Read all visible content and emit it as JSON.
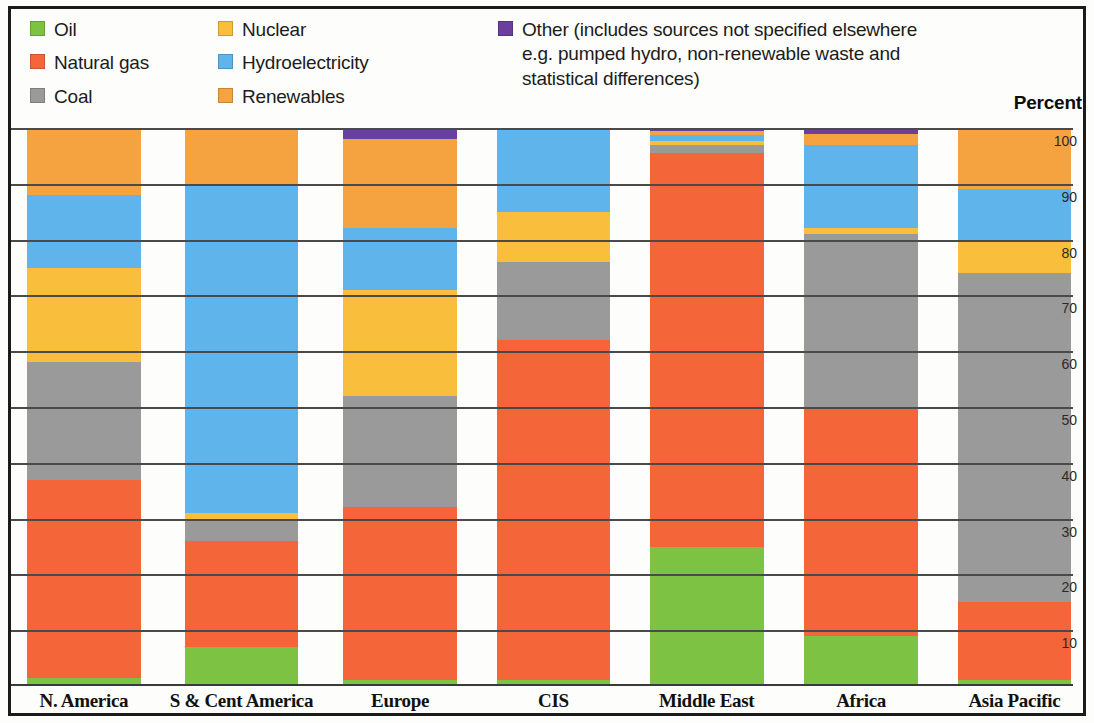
{
  "legend": {
    "columns": [
      {
        "items": [
          {
            "label": "Oil",
            "key": "oil",
            "color": "#7DC242"
          },
          {
            "label": "Natural gas",
            "key": "gas",
            "color": "#F4663A"
          },
          {
            "label": "Coal",
            "key": "coal",
            "color": "#9A9A9A"
          }
        ]
      },
      {
        "items": [
          {
            "label": "Nuclear",
            "key": "nuclear",
            "color": "#F9BE3C"
          },
          {
            "label": "Hydroelectricity",
            "key": "hydro",
            "color": "#60B4EC"
          },
          {
            "label": "Renewables",
            "key": "renewables",
            "color": "#F5A340"
          }
        ]
      },
      {
        "items": [
          {
            "label": "Other (includes sources not specified elsewhere\ne.g. pumped hydro, non-renewable waste and\nstatistical differences)",
            "key": "other",
            "color": "#6B3F9E"
          }
        ]
      }
    ]
  },
  "axis": {
    "unit_label": "Percent",
    "ticks": [
      100,
      90,
      80,
      70,
      60,
      50,
      40,
      30,
      20,
      10
    ],
    "min": 0,
    "max": 100
  },
  "chart_data": {
    "type": "bar",
    "title": "",
    "subtitle": "",
    "xlabel": "",
    "ylabel": "Percent",
    "ylim": [
      0,
      100
    ],
    "stacked": true,
    "normalized_to_100": true,
    "grid": true,
    "legend_position": "top",
    "categories": [
      "N. America",
      "S & Cent America",
      "Europe",
      "CIS",
      "Middle East",
      "Africa",
      "Asia Pacific"
    ],
    "stack_order_bottom_to_top": [
      "Oil",
      "Natural gas",
      "Coal",
      "Nuclear",
      "Hydroelectricity",
      "Renewables",
      "Other"
    ],
    "series": [
      {
        "name": "Oil",
        "key": "oil",
        "color": "#7DC242",
        "values": [
          1.5,
          7.0,
          1.0,
          1.0,
          25.0,
          9.0,
          1.0
        ]
      },
      {
        "name": "Natural gas",
        "key": "gas",
        "color": "#F4663A",
        "values": [
          35.5,
          19.0,
          31.0,
          61.0,
          70.5,
          41.0,
          14.0
        ]
      },
      {
        "name": "Coal",
        "key": "coal",
        "color": "#9A9A9A",
        "values": [
          21.0,
          4.0,
          20.0,
          14.0,
          1.5,
          31.0,
          59.0
        ]
      },
      {
        "name": "Nuclear",
        "key": "nuclear",
        "color": "#F9BE3C",
        "values": [
          17.0,
          1.0,
          19.0,
          9.0,
          0.6,
          1.0,
          6.0
        ]
      },
      {
        "name": "Hydroelectricity",
        "key": "hydro",
        "color": "#60B4EC",
        "values": [
          13.0,
          59.0,
          11.0,
          15.0,
          1.2,
          15.0,
          9.0
        ]
      },
      {
        "name": "Renewables",
        "key": "renewables",
        "color": "#F5A340",
        "values": [
          12.0,
          10.0,
          16.0,
          0.0,
          0.7,
          2.0,
          11.0
        ]
      },
      {
        "name": "Other",
        "key": "other",
        "color": "#6B3F9E",
        "values": [
          0.0,
          0.0,
          2.0,
          0.0,
          0.5,
          1.0,
          0.0
        ]
      }
    ]
  },
  "bar_layout": {
    "left_pcts": [
      1.5,
      16.2,
      31.0,
      45.3,
      59.6,
      74.0,
      88.3
    ],
    "width_pct": 10.6
  }
}
